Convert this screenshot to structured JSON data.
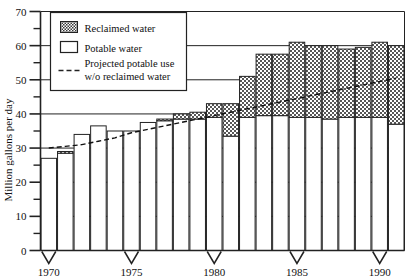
{
  "chart_data": {
    "type": "bar",
    "title": "",
    "subtitle": "",
    "xlabel": "",
    "ylabel": "Million gallons per day",
    "xlim": [
      1969.5,
      1991.5
    ],
    "ylim": [
      0,
      70
    ],
    "ytick_values": [
      0,
      10,
      20,
      30,
      40,
      50,
      60,
      70
    ],
    "ytick_labels": [
      "0",
      "10",
      "20",
      "30",
      "40",
      "50",
      "60",
      "70"
    ],
    "yminor_values": [
      5,
      15,
      25,
      35,
      45,
      55,
      65
    ],
    "xtick_values": [
      1970,
      1975,
      1980,
      1985,
      1990
    ],
    "xtick_labels": [
      "1970",
      "1975",
      "1980",
      "1985",
      "1990"
    ],
    "grid": "horizontal-major",
    "legend_position": "upper-left",
    "stacked": true,
    "categories": [
      "1970",
      "1971",
      "1972",
      "1973",
      "1974",
      "1975",
      "1976",
      "1977",
      "1978",
      "1979",
      "1980",
      "1981",
      "1982",
      "1983",
      "1984",
      "1985",
      "1986",
      "1987",
      "1988",
      "1989",
      "1990",
      "1991"
    ],
    "series": [
      {
        "name": "Potable water",
        "fill": "#ffffff",
        "values": [
          27,
          28.5,
          34,
          36.5,
          35,
          35,
          37.5,
          38,
          38.5,
          38.5,
          39,
          33.5,
          39,
          39.5,
          39.5,
          39,
          39,
          38.5,
          39,
          39,
          39,
          37
        ]
      },
      {
        "name": "Reclaimed water",
        "fill": "#8a8a8a",
        "pattern": "checker",
        "values": [
          0,
          0.5,
          0,
          0,
          0,
          0,
          0,
          0.5,
          1.5,
          2,
          4,
          9.5,
          12,
          18,
          18,
          22,
          21,
          21.5,
          20,
          20.5,
          22,
          23
        ]
      }
    ],
    "totals": [
      27,
      29,
      34,
      36.5,
      35,
      35,
      37.5,
      38.5,
      40,
      40.5,
      43,
      43,
      51,
      57.5,
      57.5,
      61,
      60,
      60,
      59,
      59.5,
      61,
      60
    ],
    "projected_line": {
      "name": "Projected potable use w/o reclaimed water",
      "style": "dashed",
      "color": "#111111",
      "x": [
        1970,
        1971,
        1972,
        1973,
        1974,
        1975,
        1976,
        1977,
        1978,
        1979,
        1980,
        1981,
        1982,
        1983,
        1984,
        1985,
        1986,
        1987,
        1988,
        1989,
        1990,
        1991
      ],
      "values": [
        30,
        30.5,
        31,
        32,
        33,
        34.5,
        35.5,
        36.5,
        37.5,
        38.5,
        39.5,
        40.5,
        41.5,
        42.5,
        43.5,
        44.5,
        45.5,
        46.5,
        47.5,
        48.5,
        49.5,
        50.5
      ]
    }
  },
  "legend": {
    "items": [
      {
        "label": "Reclaimed water",
        "swatch": "checker"
      },
      {
        "label": "Potable water",
        "swatch": "open"
      },
      {
        "label_line1": "Projected potable use",
        "label_line2": "w/o reclaimed water",
        "swatch": "dashed-line"
      }
    ]
  },
  "axis": {
    "y_title": "Million gallons per day"
  }
}
